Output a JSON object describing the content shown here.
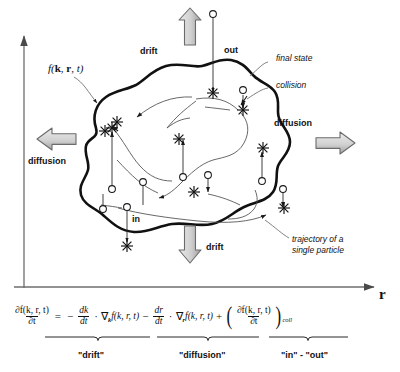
{
  "figure": {
    "type": "physics-schematic",
    "axes": {
      "x_label": "r",
      "y_label": ""
    },
    "annotations": {
      "drift_top": "drift",
      "drift_bottom": "drift",
      "diffusion_left": "diffusion",
      "diffusion_right": "diffusion",
      "out": "out",
      "in": "in",
      "distribution": "f(k, r, t)",
      "final_state": "final state",
      "collision": "collision",
      "trajectory_line1": "trajectory of a",
      "trajectory_line2": "single particle"
    },
    "equation": {
      "lhs_num": "∂f(k, r, t)",
      "lhs_den": "∂t",
      "equals": "=",
      "minus1": "−",
      "t1_num": "dk",
      "t1_den": "dt",
      "dot1": "·",
      "t1_grad": "∇",
      "t1_grad_sub": "k",
      "t1_f": "f(k, r, t)",
      "minus2": "−",
      "t2_num": "dr",
      "t2_den": "dt",
      "dot2": "·",
      "t2_grad": "∇",
      "t2_grad_sub": "r",
      "t2_f": "f(k, r, t)",
      "plus": "+",
      "t3_num": "∂f(k, r, t)",
      "t3_den": "∂t",
      "t3_sub": "coll",
      "brace_drift": "\"drift\"",
      "brace_diffusion": "\"diffusion\"",
      "brace_inout": "\"in\" - \"out\""
    },
    "colors": {
      "ink": "#111111",
      "thin_line": "#555555",
      "arrow_fill_light": "#d9d9d9",
      "arrow_fill_dark": "#a6a6a6",
      "arrow_stroke": "#6b6b6b",
      "axis": "#6e6e6e",
      "background": "#ffffff"
    },
    "markers": {
      "collision_star_count": 11,
      "state_circle_count": 10,
      "star_glyph": "asterisk-star",
      "circle_glyph": "open-circle"
    }
  }
}
